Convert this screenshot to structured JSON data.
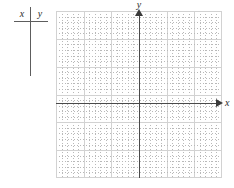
{
  "worksheet": {
    "table": {
      "name": "xy-value-table",
      "columns": [
        {
          "header": "x"
        },
        {
          "header": "y"
        }
      ],
      "rows": []
    },
    "graph": {
      "name": "coordinate-plane",
      "x_axis_label": "x",
      "y_axis_label": "y",
      "grid": {
        "minor_spacing_units": 1,
        "major_spacing_units": 5,
        "minor_color": "#b9b9b9",
        "major_color": "#d2d2d2",
        "columns": 30,
        "rows": 30
      },
      "axis_color": "#4a4a4a",
      "origin": {
        "x": 139,
        "y": 103
      },
      "plotted_points": [],
      "plotted_curves": []
    }
  },
  "chart_data": {
    "type": "scatter",
    "title": "",
    "xlabel": "x",
    "ylabel": "y",
    "x": [],
    "y": [],
    "xlim": [
      -15,
      15
    ],
    "ylim": [
      -14,
      16
    ],
    "grid": true,
    "legend": "none"
  }
}
